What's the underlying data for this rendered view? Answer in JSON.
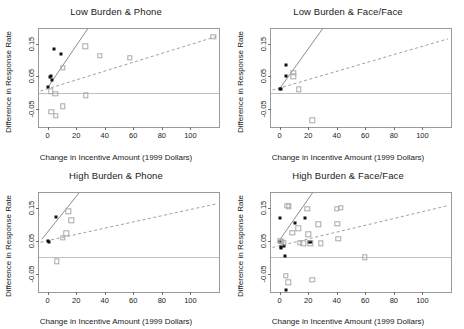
{
  "figure": {
    "layout": "2x2 grid of scatterplots",
    "panel_count": 4
  },
  "axes": {
    "xlabel": "Change in Incentive Amount (1999 Dollars)",
    "ylabel": "Difference in Response Rate",
    "xticks": [
      "0",
      "20",
      "40",
      "60",
      "80",
      "100"
    ],
    "yticks": [
      "0.15",
      "0.05",
      "-0.05"
    ],
    "xlim": [
      -6,
      120
    ],
    "ylim": [
      -0.105,
      0.195
    ],
    "xtick_values": [
      0,
      20,
      40,
      60,
      80,
      100
    ],
    "ytick_values": [
      0.15,
      0.05,
      -0.05
    ]
  },
  "style": {
    "filled_marker_color": "#111111",
    "open_marker_color": "#a8a8a8",
    "solid_line_color": "#8c8c8c",
    "dashed_line_color": "#a0a0a0",
    "frame_color": "#9a9a9a",
    "zero_line_color": "#c0c0c0"
  },
  "chart_data": [
    {
      "type": "scatter",
      "title": "Low Burden & Phone",
      "xlabel": "Change in Incentive Amount (1999 Dollars)",
      "ylabel": "Difference in Response Rate",
      "xlim": [
        -6,
        120
      ],
      "ylim": [
        -0.105,
        0.195
      ],
      "grid": false,
      "legend": "none",
      "series": [
        {
          "name": "filled",
          "marker": "filled-square",
          "points": [
            {
              "x": 0.5,
              "y": 0.018
            },
            {
              "x": 2.0,
              "y": 0.047
            },
            {
              "x": 2.6,
              "y": 0.052
            },
            {
              "x": 3.2,
              "y": 0.04
            },
            {
              "x": 4.5,
              "y": 0.135
            },
            {
              "x": 9.5,
              "y": 0.118
            }
          ]
        },
        {
          "name": "open",
          "marker": "open-square",
          "points": [
            {
              "x": 2.2,
              "y": 0.004
            },
            {
              "x": 2.6,
              "y": -0.058
            },
            {
              "x": 5.5,
              "y": -0.003
            },
            {
              "x": 5.8,
              "y": -0.07
            },
            {
              "x": 10.5,
              "y": 0.077
            },
            {
              "x": 10.8,
              "y": -0.042
            },
            {
              "x": 26.5,
              "y": 0.142
            },
            {
              "x": 26.8,
              "y": -0.008
            },
            {
              "x": 36.5,
              "y": 0.113
            },
            {
              "x": 57.5,
              "y": 0.107
            },
            {
              "x": 116.0,
              "y": 0.172
            }
          ]
        }
      ],
      "fit_lines": [
        {
          "name": "solid-fit",
          "style": "solid",
          "x1": 0,
          "y1": 0.015,
          "x2": 28,
          "y2": 0.195
        },
        {
          "name": "dashed-fit",
          "style": "dashed",
          "x1": -5,
          "y1": 0.005,
          "x2": 118,
          "y2": 0.172
        }
      ],
      "reference_line": {
        "name": "zero-line",
        "y": 0.0
      }
    },
    {
      "type": "scatter",
      "title": "Low Burden & Face/Face",
      "xlabel": "Change in Incentive Amount (1999 Dollars)",
      "ylabel": "Difference in Response Rate",
      "xlim": [
        -6,
        120
      ],
      "ylim": [
        -0.105,
        0.195
      ],
      "grid": false,
      "legend": "none",
      "series": [
        {
          "name": "filled",
          "marker": "filled-square",
          "points": [
            {
              "x": 0.4,
              "y": 0.012
            },
            {
              "x": 1.2,
              "y": 0.01
            },
            {
              "x": 4.2,
              "y": 0.052
            },
            {
              "x": 4.4,
              "y": 0.086
            }
          ]
        },
        {
          "name": "open",
          "marker": "open-square",
          "points": [
            {
              "x": 9.5,
              "y": 0.06
            },
            {
              "x": 9.6,
              "y": 0.05
            },
            {
              "x": 13.5,
              "y": 0.01
            },
            {
              "x": 23.0,
              "y": -0.085
            }
          ]
        }
      ],
      "fit_lines": [
        {
          "name": "solid-fit",
          "style": "solid",
          "x1": 0,
          "y1": 0.012,
          "x2": 30,
          "y2": 0.195
        },
        {
          "name": "dashed-fit",
          "style": "dashed",
          "x1": -5,
          "y1": 0.008,
          "x2": 118,
          "y2": 0.165
        }
      ],
      "reference_line": {
        "name": "zero-line",
        "y": 0.0
      }
    },
    {
      "type": "scatter",
      "title": "High Burden & Phone",
      "xlabel": "Change in Incentive Amount (1999 Dollars)",
      "ylabel": "Difference in Response Rate",
      "xlim": [
        -6,
        120
      ],
      "ylim": [
        -0.105,
        0.195
      ],
      "grid": false,
      "legend": "none",
      "series": [
        {
          "name": "filled",
          "marker": "filled-square",
          "points": [
            {
              "x": 0.3,
              "y": 0.05
            },
            {
              "x": 1.0,
              "y": 0.048
            },
            {
              "x": 6.0,
              "y": 0.122
            }
          ]
        },
        {
          "name": "open",
          "marker": "open-square",
          "points": [
            {
              "x": 6.5,
              "y": -0.012
            },
            {
              "x": 10.5,
              "y": 0.06
            },
            {
              "x": 13.0,
              "y": 0.073
            },
            {
              "x": 14.5,
              "y": 0.14
            },
            {
              "x": 16.5,
              "y": 0.112
            }
          ]
        }
      ],
      "fit_lines": [
        {
          "name": "solid-fit",
          "style": "solid",
          "x1": -4,
          "y1": 0.055,
          "x2": 22,
          "y2": 0.195
        },
        {
          "name": "dashed-fit",
          "style": "dashed",
          "x1": -5,
          "y1": 0.046,
          "x2": 118,
          "y2": 0.162
        }
      ],
      "reference_line": {
        "name": "zero-line",
        "y": 0.0
      }
    },
    {
      "type": "scatter",
      "title": "High Burden & Face/Face",
      "xlabel": "Change in Incentive Amount (1999 Dollars)",
      "ylabel": "Difference in Response Rate",
      "xlim": [
        -6,
        120
      ],
      "ylim": [
        -0.105,
        0.195
      ],
      "grid": false,
      "legend": "none",
      "series": [
        {
          "name": "filled",
          "marker": "filled-square",
          "points": [
            {
              "x": 0.3,
              "y": 0.12
            },
            {
              "x": 0.5,
              "y": 0.048
            },
            {
              "x": 0.8,
              "y": 0.03
            },
            {
              "x": 1.2,
              "y": 0.028
            },
            {
              "x": 3.2,
              "y": 0.034
            },
            {
              "x": 4.0,
              "y": 0.004
            },
            {
              "x": 4.2,
              "y": -0.098
            },
            {
              "x": 10.5,
              "y": 0.105
            },
            {
              "x": 17.5,
              "y": 0.12
            },
            {
              "x": 20.5,
              "y": 0.046
            },
            {
              "x": 22.0,
              "y": 0.046
            }
          ]
        },
        {
          "name": "open",
          "marker": "open-square",
          "points": [
            {
              "x": 0.6,
              "y": 0.05
            },
            {
              "x": 1.5,
              "y": 0.047
            },
            {
              "x": 3.0,
              "y": 0.045
            },
            {
              "x": 4.5,
              "y": -0.055
            },
            {
              "x": 5.5,
              "y": 0.156
            },
            {
              "x": 6.0,
              "y": -0.076
            },
            {
              "x": 6.5,
              "y": 0.155
            },
            {
              "x": 9.0,
              "y": 0.075
            },
            {
              "x": 13.0,
              "y": 0.088
            },
            {
              "x": 14.0,
              "y": 0.044
            },
            {
              "x": 16.5,
              "y": 0.043
            },
            {
              "x": 19.5,
              "y": 0.148
            },
            {
              "x": 20.0,
              "y": 0.07
            },
            {
              "x": 21.5,
              "y": 0.042
            },
            {
              "x": 23.0,
              "y": -0.068
            },
            {
              "x": 27.0,
              "y": 0.1
            },
            {
              "x": 29.0,
              "y": 0.043
            },
            {
              "x": 40.0,
              "y": 0.148
            },
            {
              "x": 40.5,
              "y": 0.102
            },
            {
              "x": 41.0,
              "y": 0.056
            },
            {
              "x": 43.0,
              "y": 0.15
            },
            {
              "x": 59.5,
              "y": 0.0
            }
          ]
        }
      ],
      "fit_lines": [
        {
          "name": "solid-fit",
          "style": "solid",
          "x1": -1,
          "y1": 0.046,
          "x2": 23,
          "y2": 0.195
        },
        {
          "name": "dashed-fit",
          "style": "dashed",
          "x1": -5,
          "y1": 0.03,
          "x2": 118,
          "y2": 0.157
        }
      ],
      "reference_line": {
        "name": "zero-line",
        "y": 0.0
      }
    }
  ]
}
